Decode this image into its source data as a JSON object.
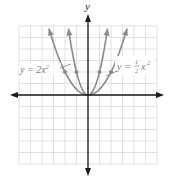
{
  "chart_data": {
    "type": "line",
    "title": "",
    "xlabel": "",
    "ylabel": "y",
    "xlim": [
      -6,
      6
    ],
    "ylim": [
      -6,
      6
    ],
    "grid": true,
    "legend_position": "inline-annotations",
    "series": [
      {
        "name": "y = 2x²",
        "equation": "y = 2x^2",
        "coefficient": 2,
        "points": [
          [
            -1.7,
            5.8
          ],
          [
            -1,
            2
          ],
          [
            0,
            0
          ],
          [
            1,
            2
          ],
          [
            1.7,
            5.8
          ]
        ],
        "marked_points": [
          [
            -1,
            2
          ],
          [
            1,
            2
          ]
        ],
        "color": "#8a8a8a"
      },
      {
        "name": "y = ½x²",
        "equation": "y = (1/2)x^2",
        "coefficient": 0.5,
        "points": [
          [
            -3.4,
            5.8
          ],
          [
            -2,
            2
          ],
          [
            0,
            0
          ],
          [
            2,
            2
          ],
          [
            3.4,
            5.8
          ]
        ],
        "marked_points": [
          [
            -2,
            2
          ],
          [
            2,
            2
          ]
        ],
        "color": "#8a8a8a"
      }
    ],
    "annotations": [
      {
        "text": "y = 2x²",
        "points_to": "y = 2x²",
        "side": "left"
      },
      {
        "text": "y = ½x²",
        "points_to": "y = ½x²",
        "side": "right"
      }
    ]
  },
  "labels": {
    "y_axis": "y",
    "left_eq_prefix": "y = 2x",
    "left_eq_exp": "2",
    "right_eq_prefix": "y = ",
    "right_frac_num": "1",
    "right_frac_den": "2",
    "right_eq_var": "x",
    "right_eq_exp": "2"
  },
  "colors": {
    "grid": "#d9d9d9",
    "axis": "#1a1a1a",
    "curve": "#8a8a8a",
    "label": "#7a7a7a"
  }
}
